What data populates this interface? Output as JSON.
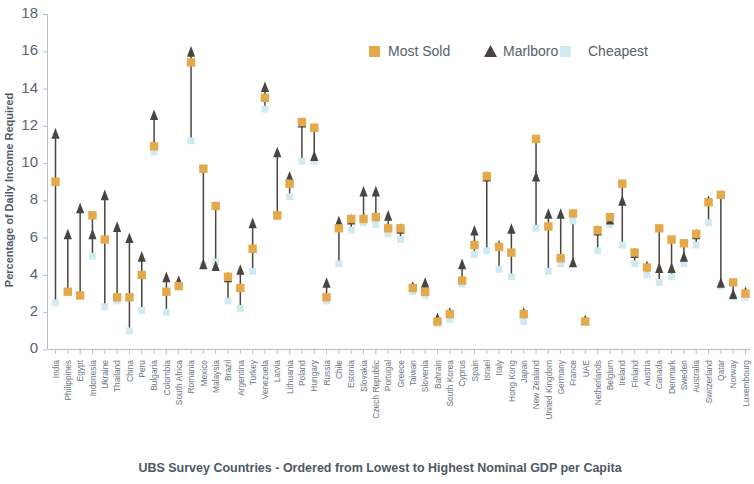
{
  "chart_data": {
    "type": "scatter",
    "title": "",
    "xlabel": "UBS Survey Countries - Ordered from Lowest to Highest Nominal GDP per Capita",
    "ylabel": "Percentage of Daily Income Required",
    "ylim": [
      0,
      18
    ],
    "yticks": [
      0,
      2,
      4,
      6,
      8,
      10,
      12,
      14,
      16,
      18
    ],
    "grid": false,
    "legend_position": "top-center",
    "colors": {
      "most_sold": "#e3a94a",
      "marlboro": "#4a4441",
      "cheapest": "#cfeaf0",
      "axis": "#b9bfc7",
      "text": "#5a6470"
    },
    "legend": [
      {
        "label": "Most Sold",
        "marker": "square",
        "color": "#e3a94a"
      },
      {
        "label": "Marlboro",
        "marker": "triangle",
        "color": "#4a4441"
      },
      {
        "label": "Cheapest",
        "marker": "square",
        "color": "#cfeaf0"
      }
    ],
    "categories": [
      "India",
      "Philippines",
      "Egypt",
      "Indonesia",
      "Ukraine",
      "Thailand",
      "China",
      "Peru",
      "Bulgaria",
      "Colombia",
      "South Africa",
      "Romania",
      "Mexico",
      "Malaysia",
      "Brazil",
      "Argentina",
      "Turkey",
      "Venezuela",
      "Latvia",
      "Lithuania",
      "Poland",
      "Hungary",
      "Russia",
      "Chile",
      "Estonia",
      "Slovakia",
      "Czech Republic",
      "Portugal",
      "Greece",
      "Taiwan",
      "Slovenia",
      "Bahrain",
      "South Korea",
      "Cyprus",
      "Spain",
      "Israel",
      "Italy",
      "Hong Kong",
      "Japan",
      "New Zealand",
      "United Kingdom",
      "Germany",
      "France",
      "UAE",
      "Netherlands",
      "Belgium",
      "Ireland",
      "Finland",
      "Austria",
      "Canada",
      "Denmark",
      "Sweden",
      "Australia",
      "Switzerland",
      "Qatar",
      "Norway",
      "Luxembourg"
    ],
    "series": [
      {
        "name": "Marlboro",
        "values": [
          11.6,
          6.2,
          7.6,
          6.2,
          8.3,
          6.6,
          6.0,
          5.0,
          12.6,
          3.9,
          3.7,
          16.0,
          4.6,
          4.5,
          3.9,
          4.3,
          6.8,
          14.1,
          10.6,
          9.3,
          12.2,
          10.4,
          3.6,
          6.9,
          7.0,
          8.5,
          8.5,
          7.2,
          6.5,
          3.4,
          3.6,
          1.7,
          2.0,
          4.6,
          6.4,
          9.3,
          5.6,
          6.5,
          2.0,
          9.3,
          7.3,
          7.3,
          4.7,
          1.6,
          6.4,
          7.0,
          8.0,
          5.2,
          4.5,
          4.4,
          4.4,
          5.0,
          6.2,
          8.0,
          3.6,
          3.0,
          3.1
        ]
      },
      {
        "name": "Most Sold",
        "values": [
          9.0,
          3.1,
          2.9,
          7.2,
          5.9,
          2.8,
          2.8,
          4.0,
          10.9,
          3.1,
          3.4,
          15.4,
          9.7,
          7.7,
          3.9,
          3.3,
          5.4,
          13.5,
          7.2,
          8.9,
          12.2,
          11.9,
          2.8,
          6.5,
          7.0,
          7.0,
          7.1,
          6.5,
          6.5,
          3.3,
          3.1,
          1.5,
          1.9,
          3.7,
          5.6,
          9.3,
          5.5,
          5.2,
          1.9,
          11.3,
          6.6,
          4.9,
          7.3,
          1.5,
          6.4,
          7.1,
          8.9,
          5.2,
          4.4,
          6.5,
          5.9,
          5.7,
          6.2,
          7.9,
          8.3,
          3.6,
          3.0
        ]
      },
      {
        "name": "Cheapest",
        "values": [
          2.5,
          3.1,
          2.9,
          5.0,
          2.3,
          2.6,
          1.0,
          2.1,
          10.6,
          2.0,
          3.4,
          11.2,
          4.5,
          4.7,
          2.6,
          2.2,
          4.2,
          12.9,
          7.1,
          8.2,
          10.1,
          10.1,
          2.6,
          4.6,
          6.4,
          6.8,
          6.7,
          6.2,
          5.9,
          3.1,
          2.9,
          1.4,
          1.6,
          3.5,
          5.1,
          5.3,
          4.3,
          3.9,
          1.5,
          6.5,
          4.2,
          4.6,
          6.9,
          1.5,
          5.3,
          6.7,
          5.6,
          4.6,
          4.0,
          3.6,
          3.9,
          4.6,
          5.6,
          6.8,
          3.4,
          2.8,
          2.8
        ]
      }
    ]
  },
  "legend": {
    "most_sold": "Most Sold",
    "marlboro": "Marlboro",
    "cheapest": "Cheapest"
  },
  "axes": {
    "y_title": "Percentage of Daily Income Required",
    "x_title": "UBS Survey Countries - Ordered from Lowest to Highest Nominal GDP per Capita"
  }
}
